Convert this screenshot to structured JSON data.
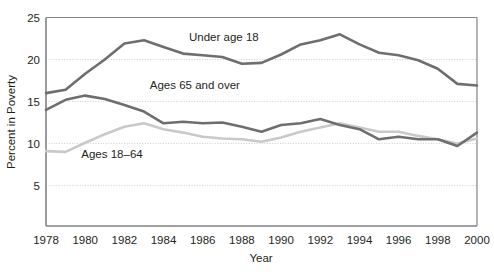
{
  "chart_data": {
    "type": "line",
    "title": "",
    "xlabel": "Year",
    "ylabel": "Percent in Poverty",
    "xlim": [
      1978,
      2000
    ],
    "ylim": [
      0,
      25
    ],
    "yticks": [
      5,
      10,
      15,
      20,
      25
    ],
    "xticks": [
      1978,
      1980,
      1982,
      1984,
      1986,
      1988,
      1990,
      1992,
      1994,
      1996,
      1998,
      2000
    ],
    "gridlines": "horizontal dotted at 5, 10, 15, 20",
    "legend_position": "inline labels on plot",
    "x": [
      1978,
      1979,
      1980,
      1981,
      1982,
      1983,
      1984,
      1985,
      1986,
      1987,
      1988,
      1989,
      1990,
      1991,
      1992,
      1993,
      1994,
      1995,
      1996,
      1997,
      1998,
      1999,
      2000
    ],
    "series": [
      {
        "name": "Under age 18",
        "color": "#6d6e70",
        "label_text": "Under age 18",
        "values": [
          16.0,
          16.4,
          18.3,
          20.0,
          21.9,
          22.3,
          21.5,
          20.7,
          20.5,
          20.3,
          19.5,
          19.6,
          20.6,
          21.8,
          22.3,
          23.0,
          21.8,
          20.8,
          20.5,
          19.9,
          18.9,
          17.1,
          16.9
        ]
      },
      {
        "name": "Ages 65 and over",
        "color": "#6d6e70",
        "label_text": "Ages 65 and over",
        "values": [
          14.0,
          15.2,
          15.7,
          15.3,
          14.6,
          13.8,
          12.4,
          12.6,
          12.4,
          12.5,
          12.0,
          11.4,
          12.2,
          12.4,
          12.9,
          12.2,
          11.7,
          10.5,
          10.8,
          10.5,
          10.5,
          9.7,
          11.3
        ]
      },
      {
        "name": "Ages 18-64",
        "color": "#c8c9ca",
        "label_text": "Ages 18–64",
        "values": [
          9.1,
          9.0,
          10.1,
          11.1,
          12.0,
          12.4,
          11.7,
          11.3,
          10.8,
          10.6,
          10.5,
          10.2,
          10.7,
          11.4,
          11.9,
          12.4,
          11.9,
          11.4,
          11.4,
          10.9,
          10.5,
          10.0,
          10.6
        ]
      }
    ],
    "annotations": [
      {
        "text": "Under age 18",
        "x": 1985.3,
        "y": 22.2
      },
      {
        "text": "Ages 65 and over",
        "x": 1983.3,
        "y": 16.5
      },
      {
        "text": "Ages 18–64",
        "x": 1979.8,
        "y": 8.3
      }
    ]
  }
}
